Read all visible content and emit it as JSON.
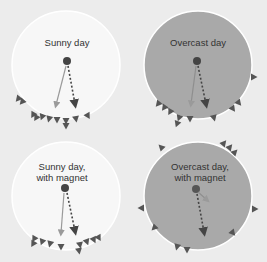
{
  "colors": {
    "background": "#ececec",
    "sunny_fill": "#f7f7f7",
    "overcast_fill": "#a9a9a9",
    "circle_stroke": "#ffffff",
    "marker": "#555555",
    "solid_arrow": "#9a9a9a",
    "dotted_arrow": "#444444",
    "center_dot": "#444444"
  },
  "panels": [
    {
      "id": "sunny",
      "label": "Sunny day"
    },
    {
      "id": "overcast",
      "label": "Overcast day"
    },
    {
      "id": "sunny-magnet",
      "label": "Sunny day, with magnet"
    },
    {
      "id": "overcast-magnet",
      "label": "Overcast day, with magnet"
    }
  ],
  "legend_semantics": {
    "solid_arrow": "expected direction",
    "dotted_arrow": "observed mean direction",
    "triangles": "individual headings"
  }
}
